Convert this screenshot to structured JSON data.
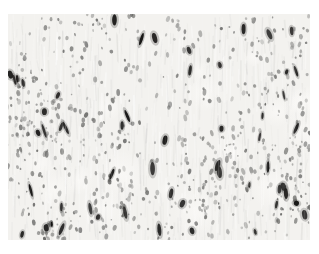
{
  "figure": {
    "type": "histology-micrograph",
    "page_background": "#ffffff",
    "canvas": {
      "x": 8,
      "y": 14,
      "width": 302,
      "height": 226
    },
    "palette": {
      "tissue_base": "#f3f2ef",
      "fiber_light": "#ffffff",
      "pale_patch": "#fbfaf8",
      "dark_cell": "#1e1d1b"
    },
    "render": {
      "seed": 1337,
      "fiber_count": 460,
      "white_fiber_count": 220,
      "pale_patch_count": 18,
      "cluster_count": 14,
      "nucleus_count": 760,
      "nucleus_gray_min": 95,
      "nucleus_gray_max": 178,
      "fiber_gray_min": 196,
      "fiber_gray_max": 228,
      "dark_cell_count": 56,
      "comb_line_count": 90
    }
  }
}
